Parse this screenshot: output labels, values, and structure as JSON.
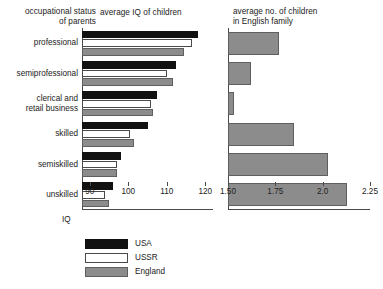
{
  "titles": {
    "left_axis_title": "occupational status\nof parents",
    "left_chart_title": "average IQ  of children",
    "right_chart_title": "average no. of children\nin English family"
  },
  "categories": [
    "professional",
    "semiprofessional",
    "clerical and\nretail business",
    "skilled",
    "semiskilled",
    "unskilled"
  ],
  "axes": {
    "iq_label": "IQ",
    "iq_ticks": [
      "90",
      "100",
      "110",
      "120"
    ],
    "family_ticks": [
      "1.50",
      "1.75",
      "2.0",
      "2.25"
    ]
  },
  "legend": [
    {
      "label": "USA",
      "color": "#111111"
    },
    {
      "label": "USSR",
      "color": "#ffffff"
    },
    {
      "label": "England",
      "color": "#8c8c8c"
    }
  ],
  "chart_data": [
    {
      "type": "bar",
      "title": "average IQ  of children",
      "orientation": "horizontal",
      "xlabel": "IQ",
      "ylabel": "occupational status of parents",
      "xlim": [
        88,
        122
      ],
      "xticks": [
        90,
        100,
        110,
        120
      ],
      "grid": false,
      "legend_position": "bottom-left",
      "categories": [
        "professional",
        "semiprofessional",
        "clerical and retail business",
        "skilled",
        "semiskilled",
        "unskilled"
      ],
      "series": [
        {
          "name": "USA",
          "color": "#111111",
          "values": [
            118.0,
            112.5,
            107.5,
            105.0,
            98.0,
            96.0
          ]
        },
        {
          "name": "USSR",
          "color": "#ffffff",
          "values": [
            116.5,
            110.0,
            106.0,
            100.5,
            97.0,
            94.0
          ]
        },
        {
          "name": "England",
          "color": "#8c8c8c",
          "values": [
            114.5,
            111.5,
            106.5,
            101.5,
            97.0,
            95.0
          ]
        }
      ]
    },
    {
      "type": "bar",
      "title": "average no. of children in English family",
      "orientation": "horizontal",
      "xlabel": "",
      "ylabel": "occupational status of parents",
      "xlim": [
        1.5,
        2.25
      ],
      "xticks": [
        1.5,
        1.75,
        2.0,
        2.25
      ],
      "grid": false,
      "categories": [
        "professional",
        "semiprofessional",
        "clerical and retail business",
        "skilled",
        "semiskilled",
        "unskilled"
      ],
      "series": [
        {
          "name": "England",
          "color": "#8c8c8c",
          "values": [
            1.77,
            1.62,
            1.53,
            1.85,
            2.03,
            2.13
          ]
        }
      ]
    }
  ]
}
